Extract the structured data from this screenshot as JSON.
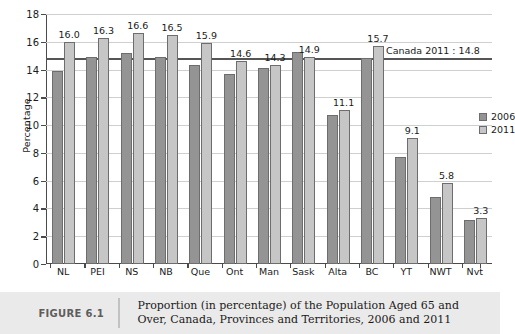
{
  "figure": {
    "number_label": "FIGURE 6.1",
    "caption_line1": "Proportion (in percentage) of the Population Aged 65 and",
    "caption_line2": "Over, Canada, Provinces and Territories, 2006 and 2011"
  },
  "legend": {
    "position": "right-inside",
    "entries": [
      {
        "label": "2006",
        "color": "#949494"
      },
      {
        "label": "2011",
        "color": "#c6c6c6"
      }
    ]
  },
  "annotation": {
    "reference_line_label": "Canada 2011 : 14.8",
    "reference_line_value": 14.8
  },
  "chart_data": {
    "type": "bar",
    "title": "",
    "xlabel": "",
    "ylabel": "Percentage",
    "ylim": [
      0,
      18
    ],
    "yticks": [
      0,
      2,
      4,
      6,
      8,
      10,
      12,
      14,
      16,
      18
    ],
    "ytick_labels": [
      "0",
      "2",
      "4",
      "6",
      "8",
      "10",
      "12",
      "14",
      "16",
      "18"
    ],
    "grid": true,
    "legend_position": "right-inside",
    "categories": [
      "NL",
      "PEI",
      "NS",
      "NB",
      "Que",
      "Ont",
      "Man",
      "Sask",
      "Alta",
      "BC",
      "YT",
      "NWT",
      "Nvt"
    ],
    "series": [
      {
        "name": "2006",
        "color": "#949494",
        "values": [
          13.9,
          14.9,
          15.2,
          14.9,
          14.3,
          13.7,
          14.1,
          15.3,
          10.7,
          14.8,
          7.7,
          4.8,
          3.2
        ],
        "labelled": false
      },
      {
        "name": "2011",
        "color": "#c6c6c6",
        "values": [
          16.0,
          16.3,
          16.6,
          16.5,
          15.9,
          14.6,
          14.3,
          14.9,
          11.1,
          15.7,
          9.1,
          5.8,
          3.3
        ],
        "labelled": true,
        "data_labels": [
          "16.0",
          "16.3",
          "16.6",
          "16.5",
          "15.9",
          "14.6",
          "14.3",
          "14.9",
          "11.1",
          "15.7",
          "9.1",
          "5.8",
          "3.3"
        ]
      }
    ],
    "reference_line": {
      "value": 14.8,
      "label": "Canada 2011 : 14.8"
    }
  }
}
